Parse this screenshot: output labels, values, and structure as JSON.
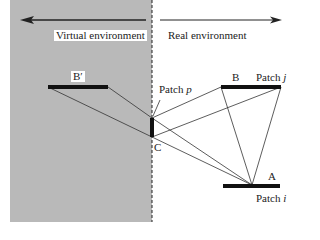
{
  "diagram": {
    "regions": {
      "virtual": {
        "label": "Virtual environment",
        "fill": "#b9b9b9"
      },
      "real": {
        "label": "Real environment",
        "fill": "#ffffff"
      }
    },
    "points": {
      "b_prime": "B′",
      "b": "B",
      "a": "A",
      "c": "C"
    },
    "patches": {
      "p": {
        "prefix": "Patch",
        "var": "p"
      },
      "j": {
        "prefix": "Patch",
        "var": "j"
      },
      "i": {
        "prefix": "Patch",
        "var": "i"
      }
    },
    "colors": {
      "line": "#333333",
      "patch": "#111111",
      "text": "#222222"
    }
  }
}
